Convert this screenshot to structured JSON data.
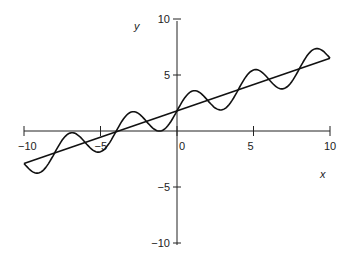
{
  "chart_data": {
    "type": "line",
    "title": "",
    "xlabel": "x",
    "ylabel": "y",
    "xlim": [
      -10,
      10
    ],
    "ylim": [
      -10,
      10
    ],
    "x_ticks": [
      "-10",
      "-5",
      "0",
      "5",
      "10"
    ],
    "y_ticks": [
      "10",
      "5",
      "0",
      "-5",
      "-10"
    ],
    "grid": false,
    "legend": null,
    "series": [
      {
        "name": "line",
        "formula": "y = 0.47x + 1.8",
        "points": [
          [
            -10,
            -2.9
          ],
          [
            10,
            6.5
          ]
        ]
      },
      {
        "name": "oscillating",
        "formula": "y = 0.47x + 1.8 + 1.3*sin(pi*x/2)",
        "x_range": [
          -10,
          10
        ]
      }
    ]
  },
  "labels": {
    "x_axis": "x",
    "y_axis": "y"
  }
}
